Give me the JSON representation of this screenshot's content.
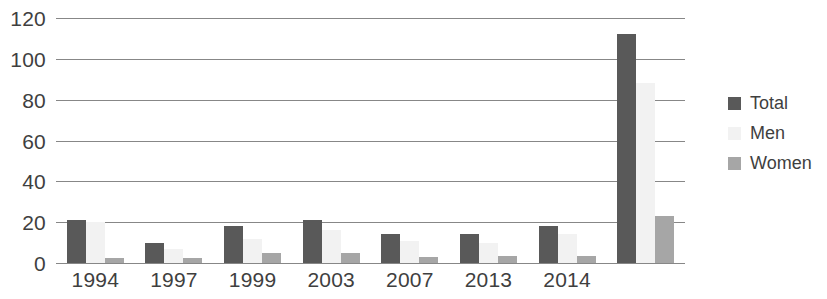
{
  "chart_data": {
    "type": "bar",
    "title": "",
    "subtitle": "",
    "xlabel": "",
    "ylabel": "",
    "grid": true,
    "legend_position": "right",
    "ylim": [
      0,
      120
    ],
    "yticks": [
      0,
      20,
      40,
      60,
      80,
      100,
      120
    ],
    "ytick_labels": [
      "0",
      "20",
      "40",
      "60",
      "80",
      "100",
      "120"
    ],
    "categories": [
      "1994",
      "1997",
      "1999",
      "2003",
      "2007",
      "2013",
      "2014",
      ""
    ],
    "series": [
      {
        "name": "Total",
        "color": "#595959",
        "values": [
          21,
          10,
          18,
          21,
          14,
          14,
          18,
          112
        ]
      },
      {
        "name": "Men",
        "color": "#f2f2f2",
        "values": [
          20,
          7,
          12,
          16,
          11,
          10,
          14,
          88
        ]
      },
      {
        "name": "Women",
        "color": "#a6a6a6",
        "values": [
          2.5,
          2.5,
          5,
          5,
          3,
          3.5,
          3.5,
          23
        ]
      }
    ]
  },
  "legend": {
    "items": [
      {
        "label": "Total",
        "color": "#595959"
      },
      {
        "label": "Men",
        "color": "#f2f2f2"
      },
      {
        "label": "Women",
        "color": "#a6a6a6"
      }
    ]
  },
  "colors": {
    "total": "#595959",
    "men": "#f2f2f2",
    "women": "#a6a6a6",
    "gridline": "#878787",
    "text": "#3f3f3f",
    "background": "#ffffff"
  }
}
